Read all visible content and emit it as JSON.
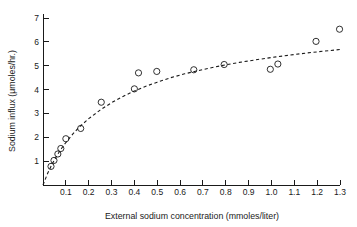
{
  "figure": {
    "background": "#ffffff",
    "ink_color": "#1a1a1a"
  },
  "chart_data": {
    "type": "scatter",
    "title": "",
    "xlabel": "External sodium concentration (mmoles/liter)",
    "ylabel": "Sodium influx (μmoles/hr.)",
    "xlim": [
      0,
      1.3
    ],
    "ylim": [
      0,
      7.3
    ],
    "grid": false,
    "legend": null,
    "xticks": [
      0.1,
      0.2,
      0.3,
      0.4,
      0.5,
      0.6,
      0.7,
      0.8,
      0.9,
      1.0,
      1.1,
      1.2,
      1.3
    ],
    "xticklabels": [
      "0.1",
      "0.2",
      "0.3",
      "0.4",
      "0.5",
      "0.6",
      "0.7",
      "0.8",
      "0.9",
      "1.0",
      "1.1",
      "1.2",
      "1.3"
    ],
    "yticks": [
      1,
      2,
      3,
      4,
      5,
      6,
      7
    ],
    "yticklabels": [
      "1",
      "2",
      "3",
      "4",
      "5",
      "6",
      "7"
    ],
    "marker": "open-circle",
    "points": [
      {
        "x": 0.035,
        "y": 0.78
      },
      {
        "x": 0.048,
        "y": 1.03
      },
      {
        "x": 0.065,
        "y": 1.3
      },
      {
        "x": 0.078,
        "y": 1.53
      },
      {
        "x": 0.1,
        "y": 1.94
      },
      {
        "x": 0.165,
        "y": 2.37
      },
      {
        "x": 0.255,
        "y": 3.47
      },
      {
        "x": 0.4,
        "y": 4.03
      },
      {
        "x": 0.418,
        "y": 4.7
      },
      {
        "x": 0.498,
        "y": 4.76
      },
      {
        "x": 0.66,
        "y": 4.83
      },
      {
        "x": 0.793,
        "y": 5.05
      },
      {
        "x": 0.995,
        "y": 4.85
      },
      {
        "x": 1.028,
        "y": 5.07
      },
      {
        "x": 1.195,
        "y": 6.02
      },
      {
        "x": 1.298,
        "y": 6.53
      }
    ],
    "fit": {
      "style": "dashed",
      "label": "",
      "model": "saturation",
      "curve": [
        {
          "x": 0.0,
          "y": 0.0
        },
        {
          "x": 0.02,
          "y": 0.48
        },
        {
          "x": 0.04,
          "y": 0.88
        },
        {
          "x": 0.06,
          "y": 1.22
        },
        {
          "x": 0.08,
          "y": 1.52
        },
        {
          "x": 0.1,
          "y": 1.78
        },
        {
          "x": 0.13,
          "y": 2.13
        },
        {
          "x": 0.16,
          "y": 2.44
        },
        {
          "x": 0.2,
          "y": 2.78
        },
        {
          "x": 0.25,
          "y": 3.14
        },
        {
          "x": 0.3,
          "y": 3.45
        },
        {
          "x": 0.35,
          "y": 3.71
        },
        {
          "x": 0.4,
          "y": 3.94
        },
        {
          "x": 0.45,
          "y": 4.14
        },
        {
          "x": 0.5,
          "y": 4.31
        },
        {
          "x": 0.56,
          "y": 4.5
        },
        {
          "x": 0.62,
          "y": 4.66
        },
        {
          "x": 0.7,
          "y": 4.84
        },
        {
          "x": 0.78,
          "y": 5.0
        },
        {
          "x": 0.86,
          "y": 5.14
        },
        {
          "x": 0.94,
          "y": 5.26
        },
        {
          "x": 1.02,
          "y": 5.37
        },
        {
          "x": 1.1,
          "y": 5.47
        },
        {
          "x": 1.18,
          "y": 5.56
        },
        {
          "x": 1.26,
          "y": 5.64
        },
        {
          "x": 1.3,
          "y": 5.68
        }
      ]
    }
  }
}
